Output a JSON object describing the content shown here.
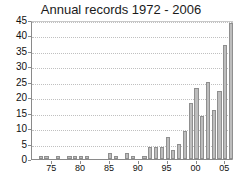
{
  "chart_data": {
    "type": "bar",
    "title": "Annual records 1972 - 2006",
    "xlabel": "",
    "ylabel": "",
    "ylim": [
      0,
      45
    ],
    "yticks": [
      0,
      5,
      10,
      15,
      20,
      25,
      30,
      35,
      40,
      45
    ],
    "grid": true,
    "legend": false,
    "bar_color": "#bdbdbd",
    "bar_edge_color": "#8f8f8f",
    "categories": [
      "1972",
      "1973",
      "1974",
      "1975",
      "1976",
      "1977",
      "1978",
      "1979",
      "1980",
      "1981",
      "1982",
      "1983",
      "1984",
      "1985",
      "1986",
      "1987",
      "1988",
      "1989",
      "1990",
      "1991",
      "1992",
      "1993",
      "1994",
      "1995",
      "1996",
      "1997",
      "1998",
      "1999",
      "2000",
      "2001",
      "2002",
      "2003",
      "2004",
      "2005",
      "2006"
    ],
    "xtick_labels": [
      "75",
      "80",
      "85",
      "90",
      "95",
      "00",
      "05"
    ],
    "xtick_categories": [
      "1975",
      "1980",
      "1985",
      "1990",
      "1995",
      "2000",
      "2005"
    ],
    "values": [
      0,
      1,
      1,
      0,
      1,
      0,
      1,
      1,
      1,
      1,
      0,
      0,
      0,
      2,
      1,
      0,
      2,
      1,
      0,
      1,
      4,
      4,
      4,
      7,
      3,
      5,
      9,
      18,
      23,
      14,
      25,
      16,
      22,
      37,
      33
    ],
    "values_note": "final bar (2006) is 44",
    "last_value": 44
  }
}
